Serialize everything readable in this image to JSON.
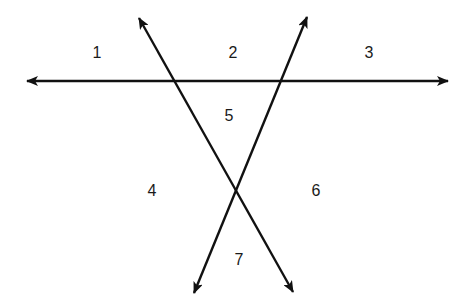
{
  "diagram": {
    "line_color": "#111111",
    "lines": [
      {
        "name": "horizontal-line",
        "x1": 27,
        "y1": 81,
        "x2": 448,
        "y2": 81
      },
      {
        "name": "line-descending",
        "x1": 139,
        "y1": 18,
        "x2": 293,
        "y2": 292
      },
      {
        "name": "line-ascending",
        "x1": 307,
        "y1": 17,
        "x2": 194,
        "y2": 293
      }
    ],
    "regions": [
      {
        "label": "1",
        "x": 97,
        "y": 53
      },
      {
        "label": "2",
        "x": 233,
        "y": 53
      },
      {
        "label": "3",
        "x": 369,
        "y": 53
      },
      {
        "label": "4",
        "x": 152,
        "y": 191
      },
      {
        "label": "5",
        "x": 229,
        "y": 116
      },
      {
        "label": "6",
        "x": 316,
        "y": 191
      },
      {
        "label": "7",
        "x": 239,
        "y": 260
      }
    ]
  }
}
